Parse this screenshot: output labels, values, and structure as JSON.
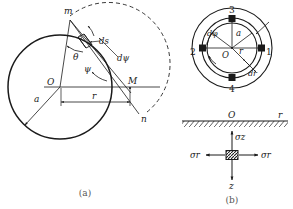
{
  "figure": {
    "background": "#ffffff",
    "stroke": "#1a1a1a",
    "caption_a": "(a)",
    "caption_b": "(b)"
  },
  "panel_a": {
    "name": "circular-disk-construction",
    "circle": {
      "cx": 60,
      "cy": 87,
      "r": 52
    },
    "dashed_arc": {
      "cx": 116,
      "cy": 84,
      "r": 44
    },
    "points": {
      "m": {
        "label": "m",
        "x": 70,
        "y": 16
      },
      "n": {
        "label": "n",
        "x": 143,
        "y": 119
      },
      "O": {
        "label": "O",
        "x": 52,
        "y": 85
      },
      "M": {
        "label": "M",
        "x": 130,
        "y": 83
      }
    },
    "labels": {
      "theta": "θ",
      "psi": "ψ",
      "ds": "ds",
      "dpsi": "dψ",
      "a": "a",
      "r": "r"
    }
  },
  "panel_b_top": {
    "name": "polar-element-annulus",
    "outer_circle": {
      "cx": 232,
      "cy": 48,
      "r": 40
    },
    "ring_outer": {
      "cx": 232,
      "cy": 48,
      "r": 30
    },
    "ring_inner": {
      "cx": 232,
      "cy": 48,
      "r": 25
    },
    "center_label": "O",
    "positions": [
      {
        "id": "1",
        "label": "1",
        "x": 267,
        "y": 52
      },
      {
        "id": "2",
        "label": "2",
        "x": 196,
        "y": 52
      },
      {
        "id": "3",
        "label": "3",
        "x": 229,
        "y": 18
      },
      {
        "id": "4",
        "label": "4",
        "x": 229,
        "y": 85
      }
    ],
    "labels": {
      "a": "a",
      "r": "r",
      "dphi": "dφ",
      "dr": "dr"
    }
  },
  "panel_b_bottom": {
    "name": "half-space-stress-element",
    "surface_y": 121,
    "surface_x1": 182,
    "surface_x2": 288,
    "origin_label": "O",
    "axis_r_label": "r",
    "axis_z_label": "z",
    "element": {
      "cx": 232,
      "cy": 155,
      "w": 12,
      "h": 9
    },
    "stresses": [
      {
        "name": "sigma-z",
        "label": "σz",
        "direction": "up"
      },
      {
        "name": "sigma-r-left",
        "label": "σr",
        "direction": "left"
      },
      {
        "name": "sigma-r-right",
        "label": "σr",
        "direction": "right"
      }
    ]
  }
}
